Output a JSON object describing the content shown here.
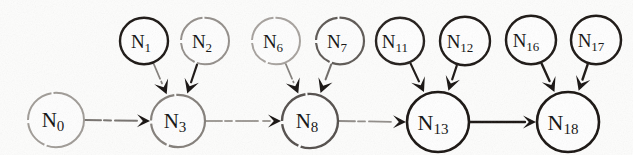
{
  "figure": {
    "type": "directed-graph",
    "background_color": "#fdfdfc",
    "ink_color": "#15110f",
    "faded_ink_color": "#8a8580",
    "canvas": {
      "width": 633,
      "height": 155
    }
  },
  "nodes": [
    {
      "id": "N0",
      "label": "N",
      "sub": "0",
      "cx": 56,
      "cy": 120,
      "r": 28,
      "stroke": "#9b9691",
      "stroke_width": 2.0,
      "dashed": true,
      "font_size": 21
    },
    {
      "id": "N1",
      "label": "N",
      "sub": "1",
      "cx": 144,
      "cy": 41,
      "r": 24,
      "stroke": "#1a1512",
      "stroke_width": 2.4,
      "dashed": false,
      "font_size": 19
    },
    {
      "id": "N2",
      "label": "N",
      "sub": "2",
      "cx": 205,
      "cy": 41,
      "r": 24,
      "stroke": "#8e8984",
      "stroke_width": 2.0,
      "dashed": true,
      "font_size": 19
    },
    {
      "id": "N3",
      "label": "N",
      "sub": "3",
      "cx": 178,
      "cy": 121,
      "r": 27,
      "stroke": "#7d7873",
      "stroke_width": 2.2,
      "dashed": true,
      "font_size": 21
    },
    {
      "id": "N6",
      "label": "N",
      "sub": "6",
      "cx": 276,
      "cy": 41,
      "r": 24,
      "stroke": "#a29d98",
      "stroke_width": 2.0,
      "dashed": true,
      "font_size": 19
    },
    {
      "id": "N7",
      "label": "N",
      "sub": "7",
      "cx": 340,
      "cy": 41,
      "r": 24,
      "stroke": "#55504c",
      "stroke_width": 2.2,
      "dashed": true,
      "font_size": 19
    },
    {
      "id": "N8",
      "label": "N",
      "sub": "8",
      "cx": 310,
      "cy": 121,
      "r": 28,
      "stroke": "#4a4542",
      "stroke_width": 2.4,
      "dashed": true,
      "font_size": 21
    },
    {
      "id": "N11",
      "label": "N",
      "sub": "11",
      "cx": 400,
      "cy": 41,
      "r": 24,
      "stroke": "#221d1a",
      "stroke_width": 2.4,
      "dashed": false,
      "font_size": 19
    },
    {
      "id": "N12",
      "label": "N",
      "sub": "12",
      "cx": 465,
      "cy": 41,
      "r": 25,
      "stroke": "#1a1512",
      "stroke_width": 2.4,
      "dashed": false,
      "font_size": 19
    },
    {
      "id": "N13",
      "label": "N",
      "sub": "13",
      "cx": 438,
      "cy": 122,
      "r": 31,
      "stroke": "#17120f",
      "stroke_width": 2.6,
      "dashed": false,
      "font_size": 22
    },
    {
      "id": "N16",
      "label": "N",
      "sub": "16",
      "cx": 531,
      "cy": 40,
      "r": 25,
      "stroke": "#1a1512",
      "stroke_width": 2.5,
      "dashed": false,
      "font_size": 19
    },
    {
      "id": "N17",
      "label": "N",
      "sub": "17",
      "cx": 596,
      "cy": 40,
      "r": 25,
      "stroke": "#1a1512",
      "stroke_width": 2.5,
      "dashed": false,
      "font_size": 19
    },
    {
      "id": "N18",
      "label": "N",
      "sub": "18",
      "cx": 568,
      "cy": 122,
      "r": 31,
      "stroke": "#17120f",
      "stroke_width": 2.6,
      "dashed": false,
      "font_size": 22
    }
  ],
  "edges": [
    {
      "from": "N0",
      "to": "N3",
      "kind": "horizontal",
      "style": "faded",
      "stroke": "#5e5955",
      "stroke_width": 2.0
    },
    {
      "from": "N1",
      "to": "N3",
      "kind": "diagonal",
      "style": "faded",
      "stroke": "#6d6864",
      "stroke_width": 1.8
    },
    {
      "from": "N2",
      "to": "N3",
      "kind": "diagonal",
      "style": "solid",
      "stroke": "#1a1512",
      "stroke_width": 2.2
    },
    {
      "from": "N3",
      "to": "N8",
      "kind": "horizontal",
      "style": "faded",
      "stroke": "#8e8984",
      "stroke_width": 1.8
    },
    {
      "from": "N6",
      "to": "N8",
      "kind": "diagonal",
      "style": "faded",
      "stroke": "#6d6864",
      "stroke_width": 1.8
    },
    {
      "from": "N7",
      "to": "N8",
      "kind": "diagonal",
      "style": "faded",
      "stroke": "#55504c",
      "stroke_width": 2.0
    },
    {
      "from": "N8",
      "to": "N13",
      "kind": "horizontal",
      "style": "faded",
      "stroke": "#7d7873",
      "stroke_width": 1.8
    },
    {
      "from": "N11",
      "to": "N13",
      "kind": "diagonal",
      "style": "solid",
      "stroke": "#1a1512",
      "stroke_width": 2.2
    },
    {
      "from": "N12",
      "to": "N13",
      "kind": "diagonal",
      "style": "solid",
      "stroke": "#1a1512",
      "stroke_width": 2.2
    },
    {
      "from": "N13",
      "to": "N18",
      "kind": "horizontal",
      "style": "solid",
      "stroke": "#17120f",
      "stroke_width": 2.4
    },
    {
      "from": "N16",
      "to": "N18",
      "kind": "diagonal",
      "style": "solid",
      "stroke": "#1a1512",
      "stroke_width": 2.4
    },
    {
      "from": "N17",
      "to": "N18",
      "kind": "diagonal",
      "style": "solid",
      "stroke": "#1a1512",
      "stroke_width": 2.4
    }
  ]
}
